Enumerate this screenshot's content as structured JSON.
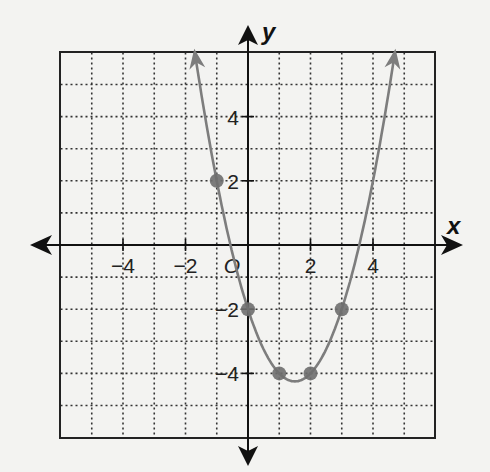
{
  "chart_data": {
    "type": "line",
    "title": "",
    "xlabel": "x",
    "ylabel": "y",
    "xlim": [
      -6,
      6
    ],
    "ylim": [
      -6,
      6
    ],
    "grid": true,
    "grid_style": "dotted",
    "origin_label": "O",
    "x_ticks": [
      {
        "value": -4,
        "label": "−4"
      },
      {
        "value": -2,
        "label": "−2"
      },
      {
        "value": 2,
        "label": "2"
      },
      {
        "value": 4,
        "label": "4"
      }
    ],
    "y_ticks": [
      {
        "value": 4,
        "label": "4"
      },
      {
        "value": 2,
        "label": "2"
      },
      {
        "value": -2,
        "label": "−2"
      },
      {
        "value": -4,
        "label": "−4"
      }
    ],
    "series": [
      {
        "name": "parabola",
        "equation": "y = x^2 - 3x - 2",
        "x_range": [
          -1.7,
          4.7
        ],
        "arrows_both_ends": true,
        "color": "#7d7d7d"
      }
    ],
    "points": [
      {
        "x": -1,
        "y": 2
      },
      {
        "x": 0,
        "y": -2
      },
      {
        "x": 1,
        "y": -4
      },
      {
        "x": 2,
        "y": -4
      },
      {
        "x": 3,
        "y": -2
      }
    ],
    "point_color": "#6e6e6e"
  }
}
